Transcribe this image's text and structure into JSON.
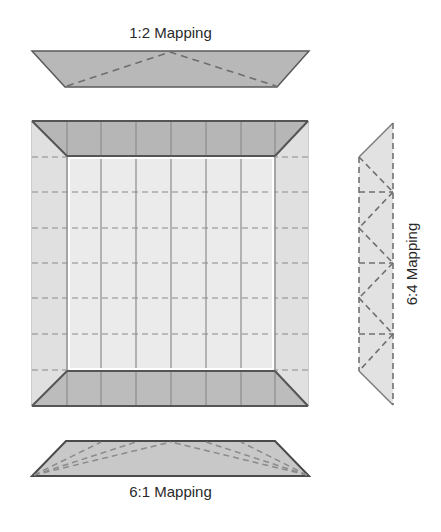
{
  "labels": {
    "top": "1:2 Mapping",
    "right": "6:4 Mapping",
    "bottom": "6:1 Mapping"
  },
  "colors": {
    "dark_fill": "#b4b4b4",
    "light_fill": "#e3e3e3",
    "inner_fill": "#e8e8e8",
    "stroke_dark": "#555555",
    "grid_solid": "#8c8c8c",
    "dashed": "#7a7a7a",
    "background": "#ffffff"
  },
  "diagram": {
    "main_square": {
      "columns": 8,
      "rows": 7,
      "bevel_width": 35
    },
    "pieces": [
      {
        "name": "top-strip",
        "mapping": "1:2",
        "dashed_edges": 2
      },
      {
        "name": "right-strip",
        "mapping": "6:4",
        "dashed_edges": 9
      },
      {
        "name": "bottom-strip",
        "mapping": "6:1",
        "dashed_edges": 6
      }
    ]
  }
}
